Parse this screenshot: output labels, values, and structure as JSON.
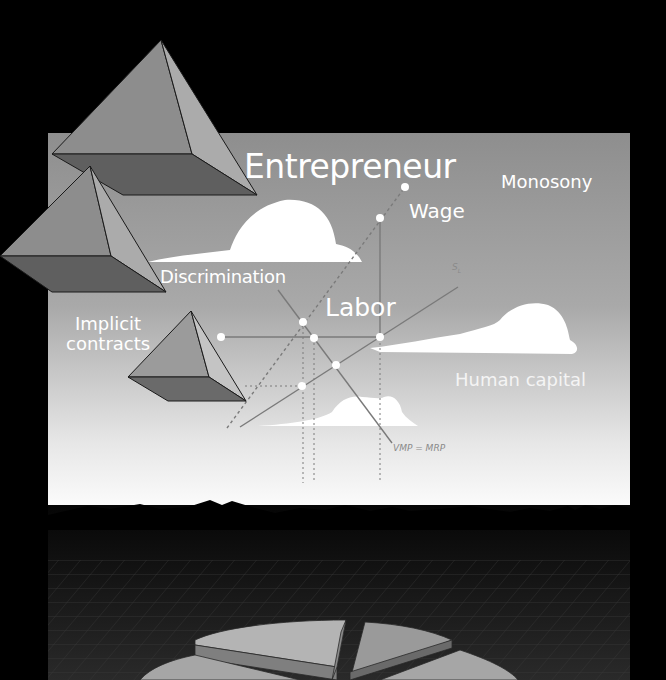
{
  "illustration": {
    "subject": "Labor economics cover illustration",
    "labels": {
      "entrepreneur": "Entrepreneur",
      "monopsony": "Monosony",
      "wage": "Wage",
      "discrimination": "Discrimination",
      "labor": "Labor",
      "implicit_line1": "Implicit",
      "implicit_line2": "contracts",
      "human_capital": "Human capital",
      "vmp_mrp": "VMP = MRP",
      "supply_curve": "S",
      "supply_curve_sub": "L"
    },
    "colors": {
      "background": "#000000",
      "panel_top": "#8f8f8f",
      "panel_bottom": "#ffffff",
      "cloud": "#ffffff",
      "line": "#7a7a7a",
      "pyramid_light": "#a8a8a8",
      "pyramid_mid": "#8c8c8c",
      "pyramid_dark": "#5e5e5e",
      "grid_floor": "#1c1c1c",
      "pie_top": "#a9a9a9",
      "pie_side": "#7c7c7c"
    }
  }
}
